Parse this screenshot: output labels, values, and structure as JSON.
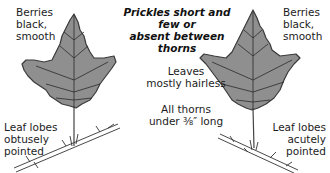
{
  "title": [
    "Prickles short and few or",
    "absent between thorns"
  ],
  "left": {
    "berries": [
      "Berries",
      "black,",
      "smooth"
    ],
    "lobes": [
      "Leaf lobes",
      "obtusely",
      "pointed"
    ]
  },
  "right": {
    "berries": [
      "Berries",
      "black,",
      "smooth"
    ],
    "lobes": [
      "Leaf lobes",
      "acutely",
      "pointed"
    ]
  },
  "center": {
    "leaves": [
      "Leaves",
      "mostly hairless"
    ],
    "thorns": [
      "All thorns",
      "under ⅜″ long"
    ]
  },
  "colors": {
    "leaf_fill": "#8f8f8f",
    "leaf_edge": "#3a3a3a",
    "vein": "#2a2a2a",
    "text": "#1c1c1c"
  }
}
